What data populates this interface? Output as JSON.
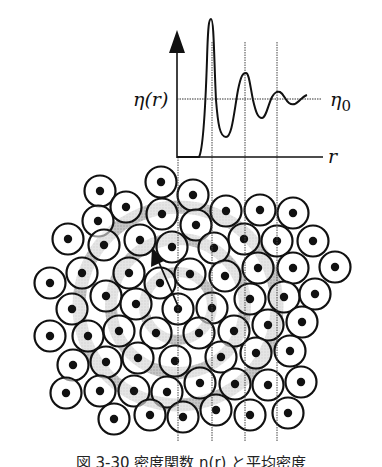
{
  "figure": {
    "type": "radial-distribution-diagram",
    "graph": {
      "y_label": "η(r)",
      "x_label": "r",
      "reference_label": "η0",
      "reference_label_main": "η",
      "reference_label_sub": "0"
    },
    "caption": "図 3-30 密度関数 η(r) と平均密度",
    "colors": {
      "ink": "#111111",
      "shade": "#a8a8a8",
      "background": "#ffffff"
    }
  },
  "chart_data": {
    "type": "line",
    "title": "",
    "xlabel": "r",
    "ylabel": "η(r)",
    "reference_line": {
      "label": "η0",
      "y": 1.0
    },
    "series": [
      {
        "name": "η(r)",
        "description": "radial density function: zero near origin, sharp first peak, then damped oscillations converging to η0",
        "x": [
          0.0,
          0.1,
          0.15,
          0.2,
          0.22,
          0.25,
          0.3,
          0.35,
          0.42,
          0.45,
          0.5,
          0.55,
          0.6,
          0.65,
          0.7,
          0.75,
          0.8,
          0.85,
          0.9,
          1.0
        ],
        "y": [
          0.0,
          0.0,
          0.05,
          1.8,
          3.0,
          1.8,
          0.5,
          0.2,
          0.6,
          1.2,
          1.6,
          0.9,
          0.6,
          0.75,
          1.15,
          1.05,
          0.9,
          0.95,
          1.02,
          1.0
        ]
      }
    ],
    "vertical_markers": [
      "shell-1",
      "shell-2",
      "shell-3"
    ],
    "grid": false,
    "legend": null
  }
}
